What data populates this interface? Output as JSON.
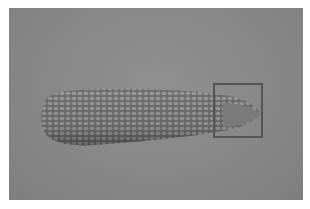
{
  "image": {
    "subject": "ear of corn",
    "style": "grayscale photograph",
    "background_color": "#8a8a8a"
  },
  "annotations": [
    {
      "type": "bounding-box",
      "label": "corn tip",
      "x": 213,
      "y": 83,
      "width": 50,
      "height": 55,
      "color": "#555555"
    }
  ]
}
